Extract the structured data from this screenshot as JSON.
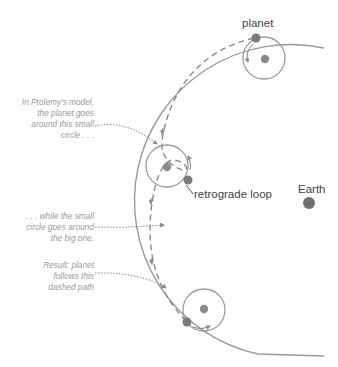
{
  "labels": {
    "planet": "planet",
    "retrograde": "retrograde loop",
    "earth": "Earth"
  },
  "notes": {
    "epicycle": [
      "In Ptolemy's model,",
      "the planet goes",
      "around this small",
      "circle . . ."
    ],
    "deferent": [
      ". . . while the small",
      "circle goes around",
      "the big one."
    ],
    "result": [
      "Result: planet",
      "follows this",
      "dashed path"
    ]
  },
  "colors": {
    "line": "#9a9a9a",
    "dot": "#7a7a7a",
    "earth": "#707070",
    "dashed": "#8a8a8a",
    "note_text": "#9a9a9a"
  }
}
